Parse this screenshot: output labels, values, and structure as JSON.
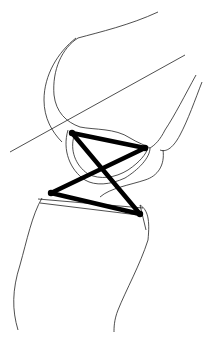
{
  "diagram": {
    "type": "knee-joint-four-bar-linkage",
    "colors": {
      "outline": "#222222",
      "linkage": "#000000",
      "background": "#ffffff"
    },
    "joints": [
      {
        "id": "femur-anterior",
        "x": 72,
        "y": 133
      },
      {
        "id": "femur-posterior",
        "x": 145,
        "y": 148
      },
      {
        "id": "tibia-anterior",
        "x": 51,
        "y": 193
      },
      {
        "id": "tibia-posterior",
        "x": 140,
        "y": 214
      }
    ]
  }
}
